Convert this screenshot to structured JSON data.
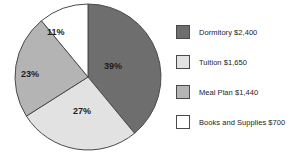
{
  "chart_data": {
    "type": "pie",
    "title": "",
    "categories": [
      "Dormitory",
      "Tuition",
      "Meal Plan",
      "Books and Supplies"
    ],
    "values": [
      39,
      27,
      23,
      11
    ],
    "value_unit": "percent",
    "amounts": [
      "$2,400",
      "$1,650",
      "$1,440",
      "$700"
    ],
    "slice_labels": [
      "39%",
      "27%",
      "23%",
      "11%"
    ],
    "colors": [
      "#6e6e6e",
      "#e2e2e2",
      "#b4b4b4",
      "#ffffff"
    ],
    "start_angle_deg": 0,
    "direction": "clockwise",
    "legend_position": "right",
    "grid": false,
    "legend": [
      {
        "label": "Dormitory $2,400",
        "color": "#6e6e6e"
      },
      {
        "label": "Tuition $1,650",
        "color": "#e2e2e2"
      },
      {
        "label": "Meal Plan $1,440",
        "color": "#b4b4b4"
      },
      {
        "label": "Books and Supplies $700",
        "color": "#ffffff"
      }
    ]
  },
  "style": {
    "outline": "#4a4a4a",
    "text": "#1c1c1c",
    "background": "#ffffff"
  }
}
